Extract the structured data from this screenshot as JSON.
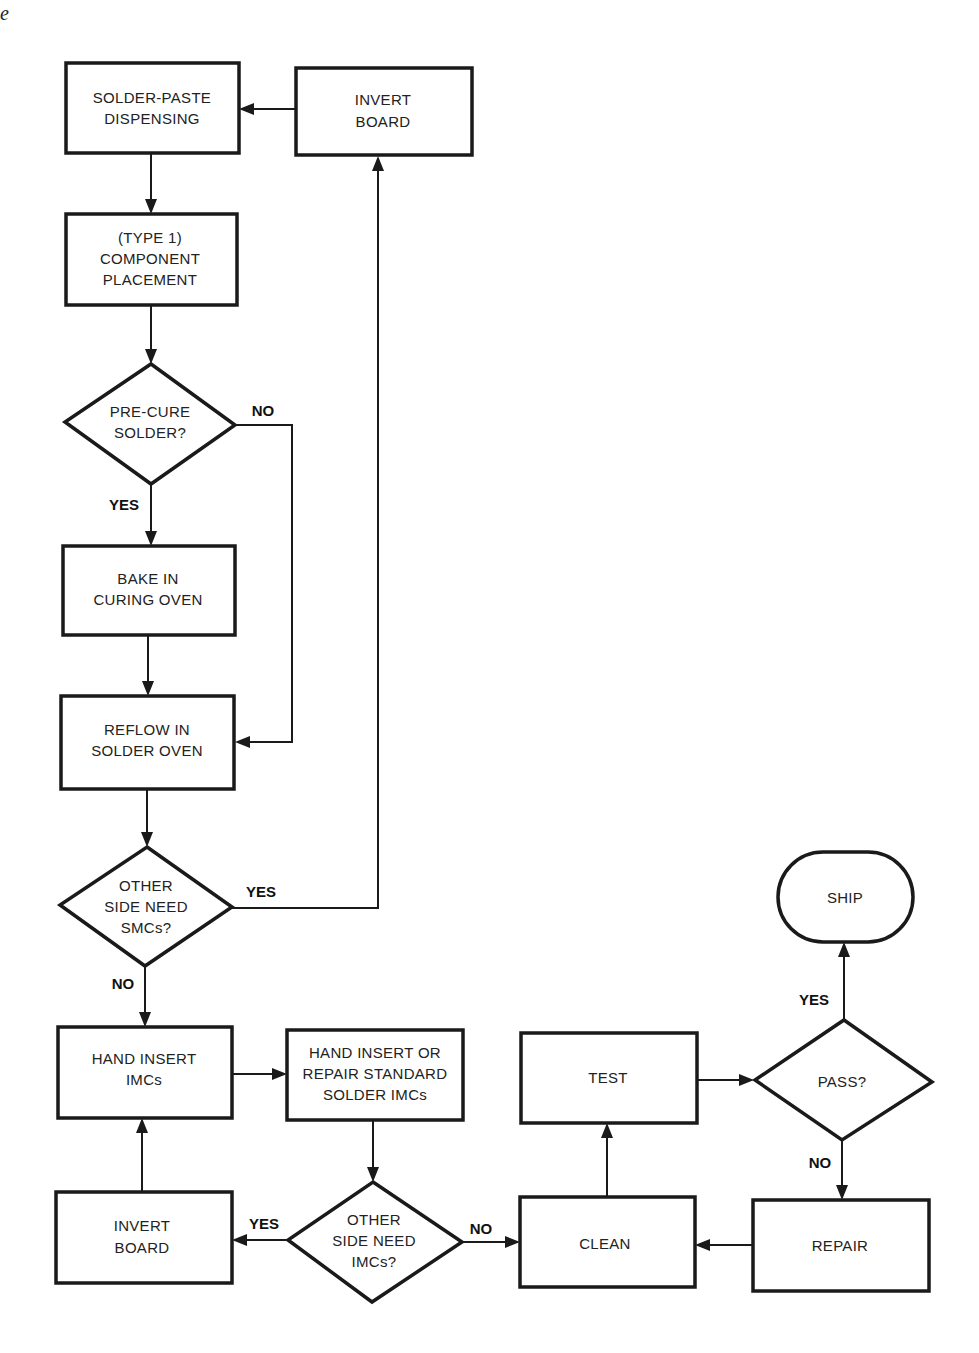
{
  "page_fragment": "e",
  "nodes": {
    "solder_paste": {
      "lines": [
        "SOLDER-PASTE",
        "DISPENSING"
      ]
    },
    "invert_board_top": {
      "lines": [
        "INVERT",
        "BOARD"
      ]
    },
    "component_placement": {
      "lines": [
        "(TYPE 1)",
        "COMPONENT",
        "PLACEMENT"
      ]
    },
    "precure": {
      "lines": [
        "PRE-CURE",
        "SOLDER?"
      ]
    },
    "bake": {
      "lines": [
        "BAKE IN",
        "CURING OVEN"
      ]
    },
    "reflow": {
      "lines": [
        "REFLOW IN",
        "SOLDER OVEN"
      ]
    },
    "other_side_smcs": {
      "lines": [
        "OTHER",
        "SIDE NEED",
        "SMCs?"
      ]
    },
    "hand_insert": {
      "lines": [
        "HAND INSERT",
        "IMCs"
      ]
    },
    "hand_insert_repair": {
      "lines": [
        "HAND INSERT OR",
        "REPAIR STANDARD",
        "SOLDER IMCs"
      ]
    },
    "invert_board_bottom": {
      "lines": [
        "INVERT",
        "BOARD"
      ]
    },
    "other_side_imcs": {
      "lines": [
        "OTHER",
        "SIDE NEED",
        "IMCs?"
      ]
    },
    "test": {
      "lines": [
        "TEST"
      ]
    },
    "clean": {
      "lines": [
        "CLEAN"
      ]
    },
    "pass": {
      "lines": [
        "PASS?"
      ]
    },
    "ship": {
      "lines": [
        "SHIP"
      ]
    },
    "repair": {
      "lines": [
        "REPAIR"
      ]
    }
  },
  "edge_labels": {
    "precure_no": "NO",
    "precure_yes": "YES",
    "smcs_yes": "YES",
    "smcs_no": "NO",
    "imcs_yes": "YES",
    "imcs_no": "NO",
    "pass_yes": "YES",
    "pass_no": "NO"
  },
  "colors": {
    "ink": "#1a1a1a",
    "paper": "#ffffff"
  }
}
